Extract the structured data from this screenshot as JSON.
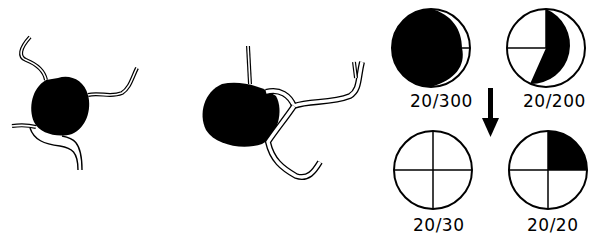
{
  "figure": {
    "panels": [
      {
        "id": "tumor-before",
        "description": "Dark pigmented lesion with four tortuous vessels radiating outward"
      },
      {
        "id": "tumor-after",
        "description": "Dark pigmented lesion with branching vessel crossing its edge"
      }
    ],
    "acuity_charts": [
      {
        "label": "20/300",
        "fill": "mostly-black-crescent-white"
      },
      {
        "label": "20/200",
        "fill": "black-right-portion"
      },
      {
        "label": "20/30",
        "fill": "all-white-quartered"
      },
      {
        "label": "20/20",
        "fill": "upper-right-quadrant-black"
      }
    ],
    "arrow": "down-arrow"
  },
  "colors": {
    "ink": "#000000",
    "paper": "#ffffff"
  }
}
